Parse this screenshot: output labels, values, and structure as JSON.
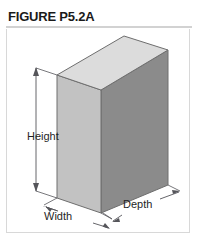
{
  "figure": {
    "title": "FIGURE P5.2A",
    "caption_rule": true
  },
  "diagram": {
    "type": "isometric-rectangular-prism",
    "shape_name": "rectangular box",
    "faces": {
      "top_color": "#dcdcdc",
      "left_color": "#c2c2c2",
      "right_color": "#8b8b8b",
      "edge_color": "#6e6e6e"
    },
    "dimension_line_color": "#55555a",
    "labels": {
      "height": "Height",
      "width": "Width",
      "depth": "Depth"
    }
  }
}
